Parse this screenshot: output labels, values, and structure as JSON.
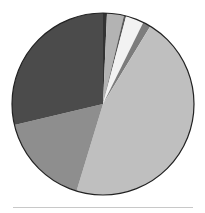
{
  "chart_data": {
    "type": "pie",
    "title": "",
    "legend": [],
    "labels": [
      "Slice 1",
      "Slice 2",
      "Slice 3",
      "Slice 4",
      "Slice 5",
      "Slice 6",
      "Slice 7",
      "Slice 8"
    ],
    "values": [
      0.7,
      3.0,
      0.4,
      3.2,
      1.4,
      46.0,
      16.6,
      28.7
    ],
    "colors": [
      "#333333",
      "#b3b3b3",
      "#5a5a5a",
      "#f2f2f2",
      "#7c7c7c",
      "#bfbfbf",
      "#8e8e8e",
      "#4b4b4b"
    ],
    "start_angle_deg": 0,
    "direction": "clockwise",
    "center": [
      103,
      104
    ],
    "radius": 91
  }
}
